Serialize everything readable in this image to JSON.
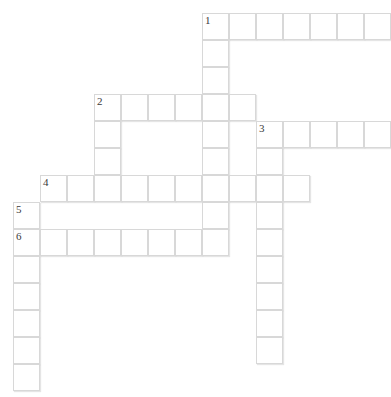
{
  "puzzle": {
    "type": "crossword-grid",
    "title": "",
    "grid": {
      "cell_size": 27,
      "origin_x": 13,
      "origin_y": 13,
      "columns": 14,
      "rows": 14,
      "cell_fill": "#ffffff",
      "cell_border": "#d8d8d8",
      "number_color": "#3a3a3a"
    },
    "numbers": [
      {
        "label": "1",
        "col": 7,
        "row": 0
      },
      {
        "label": "2",
        "col": 3,
        "row": 3
      },
      {
        "label": "3",
        "col": 9,
        "row": 4
      },
      {
        "label": "4",
        "col": 1,
        "row": 6
      },
      {
        "label": "5",
        "col": 0,
        "row": 7
      },
      {
        "label": "6",
        "col": 0,
        "row": 8
      }
    ],
    "entries": [
      {
        "number": "1",
        "direction": "across",
        "col": 7,
        "row": 0,
        "length": 7,
        "answer": ""
      },
      {
        "number": "1",
        "direction": "down",
        "col": 7,
        "row": 0,
        "length": 8,
        "answer": ""
      },
      {
        "number": "2",
        "direction": "across",
        "col": 3,
        "row": 3,
        "length": 6,
        "answer": ""
      },
      {
        "number": "2",
        "direction": "down",
        "col": 3,
        "row": 3,
        "length": 4,
        "answer": ""
      },
      {
        "number": "3",
        "direction": "across",
        "col": 9,
        "row": 4,
        "length": 5,
        "answer": ""
      },
      {
        "number": "3",
        "direction": "down",
        "col": 9,
        "row": 4,
        "length": 9,
        "answer": ""
      },
      {
        "number": "4",
        "direction": "across",
        "col": 1,
        "row": 6,
        "length": 10,
        "answer": ""
      },
      {
        "number": "5",
        "direction": "across",
        "col": 0,
        "row": 7,
        "length": 1,
        "answer": ""
      },
      {
        "number": "6",
        "direction": "across",
        "col": 0,
        "row": 8,
        "length": 8,
        "answer": ""
      },
      {
        "number": "6",
        "direction": "down",
        "col": 0,
        "row": 8,
        "length": 6,
        "answer": ""
      }
    ],
    "cells": [
      {
        "col": 7,
        "row": 0,
        "num": "1",
        "letter": ""
      },
      {
        "col": 8,
        "row": 0,
        "num": "",
        "letter": ""
      },
      {
        "col": 9,
        "row": 0,
        "num": "",
        "letter": ""
      },
      {
        "col": 10,
        "row": 0,
        "num": "",
        "letter": ""
      },
      {
        "col": 11,
        "row": 0,
        "num": "",
        "letter": ""
      },
      {
        "col": 12,
        "row": 0,
        "num": "",
        "letter": ""
      },
      {
        "col": 13,
        "row": 0,
        "num": "",
        "letter": ""
      },
      {
        "col": 7,
        "row": 1,
        "num": "",
        "letter": ""
      },
      {
        "col": 7,
        "row": 2,
        "num": "",
        "letter": ""
      },
      {
        "col": 3,
        "row": 3,
        "num": "2",
        "letter": ""
      },
      {
        "col": 4,
        "row": 3,
        "num": "",
        "letter": ""
      },
      {
        "col": 5,
        "row": 3,
        "num": "",
        "letter": ""
      },
      {
        "col": 6,
        "row": 3,
        "num": "",
        "letter": ""
      },
      {
        "col": 7,
        "row": 3,
        "num": "",
        "letter": ""
      },
      {
        "col": 8,
        "row": 3,
        "num": "",
        "letter": ""
      },
      {
        "col": 3,
        "row": 4,
        "num": "",
        "letter": ""
      },
      {
        "col": 7,
        "row": 4,
        "num": "",
        "letter": ""
      },
      {
        "col": 9,
        "row": 4,
        "num": "3",
        "letter": ""
      },
      {
        "col": 10,
        "row": 4,
        "num": "",
        "letter": ""
      },
      {
        "col": 11,
        "row": 4,
        "num": "",
        "letter": ""
      },
      {
        "col": 12,
        "row": 4,
        "num": "",
        "letter": ""
      },
      {
        "col": 13,
        "row": 4,
        "num": "",
        "letter": ""
      },
      {
        "col": 3,
        "row": 5,
        "num": "",
        "letter": ""
      },
      {
        "col": 7,
        "row": 5,
        "num": "",
        "letter": ""
      },
      {
        "col": 9,
        "row": 5,
        "num": "",
        "letter": ""
      },
      {
        "col": 1,
        "row": 6,
        "num": "4",
        "letter": ""
      },
      {
        "col": 2,
        "row": 6,
        "num": "",
        "letter": ""
      },
      {
        "col": 3,
        "row": 6,
        "num": "",
        "letter": ""
      },
      {
        "col": 4,
        "row": 6,
        "num": "",
        "letter": ""
      },
      {
        "col": 5,
        "row": 6,
        "num": "",
        "letter": ""
      },
      {
        "col": 6,
        "row": 6,
        "num": "",
        "letter": ""
      },
      {
        "col": 7,
        "row": 6,
        "num": "",
        "letter": ""
      },
      {
        "col": 8,
        "row": 6,
        "num": "",
        "letter": ""
      },
      {
        "col": 9,
        "row": 6,
        "num": "",
        "letter": ""
      },
      {
        "col": 10,
        "row": 6,
        "num": "",
        "letter": ""
      },
      {
        "col": 0,
        "row": 7,
        "num": "5",
        "letter": ""
      },
      {
        "col": 7,
        "row": 7,
        "num": "",
        "letter": ""
      },
      {
        "col": 9,
        "row": 7,
        "num": "",
        "letter": ""
      },
      {
        "col": 0,
        "row": 8,
        "num": "6",
        "letter": ""
      },
      {
        "col": 1,
        "row": 8,
        "num": "",
        "letter": ""
      },
      {
        "col": 2,
        "row": 8,
        "num": "",
        "letter": ""
      },
      {
        "col": 3,
        "row": 8,
        "num": "",
        "letter": ""
      },
      {
        "col": 4,
        "row": 8,
        "num": "",
        "letter": ""
      },
      {
        "col": 5,
        "row": 8,
        "num": "",
        "letter": ""
      },
      {
        "col": 6,
        "row": 8,
        "num": "",
        "letter": ""
      },
      {
        "col": 7,
        "row": 8,
        "num": "",
        "letter": ""
      },
      {
        "col": 9,
        "row": 8,
        "num": "",
        "letter": ""
      },
      {
        "col": 0,
        "row": 9,
        "num": "",
        "letter": ""
      },
      {
        "col": 9,
        "row": 9,
        "num": "",
        "letter": ""
      },
      {
        "col": 0,
        "row": 10,
        "num": "",
        "letter": ""
      },
      {
        "col": 9,
        "row": 10,
        "num": "",
        "letter": ""
      },
      {
        "col": 0,
        "row": 11,
        "num": "",
        "letter": ""
      },
      {
        "col": 9,
        "row": 11,
        "num": "",
        "letter": ""
      },
      {
        "col": 0,
        "row": 12,
        "num": "",
        "letter": ""
      },
      {
        "col": 9,
        "row": 12,
        "num": "",
        "letter": ""
      },
      {
        "col": 0,
        "row": 13,
        "num": "",
        "letter": ""
      }
    ]
  }
}
